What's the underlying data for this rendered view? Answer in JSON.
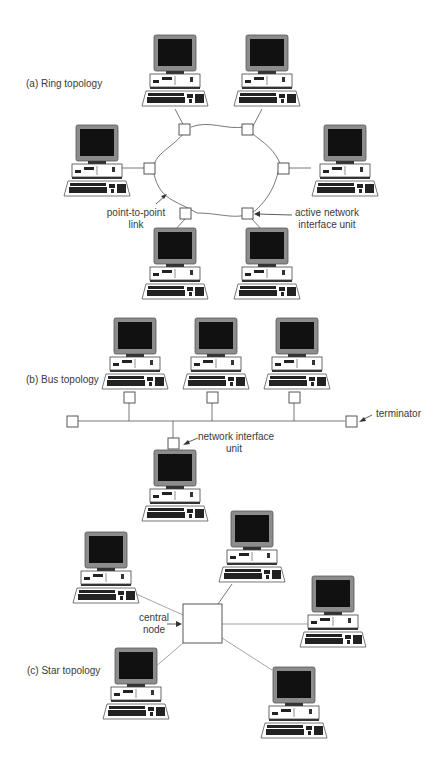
{
  "figure": {
    "sections": [
      {
        "id": "ring",
        "title": "(a) Ring topology",
        "annotations": {
          "link": [
            "point-to-point",
            "link"
          ],
          "niu": [
            "active network",
            "interface unit"
          ]
        },
        "computers": 6,
        "interface_units": 6
      },
      {
        "id": "bus",
        "title": "(b) Bus topology",
        "annotations": {
          "terminator": "terminator",
          "niu": [
            "network interface",
            "unit"
          ]
        },
        "computers": 4,
        "interface_units": 4,
        "terminators": 2
      },
      {
        "id": "star",
        "title": "(c) Star topology",
        "annotations": {
          "central": [
            "central",
            "node"
          ]
        },
        "computers": 5,
        "central_nodes": 1
      }
    ],
    "colors": {
      "line": "#555555",
      "monitor_bezel": "#8c8c8c",
      "screen": "#111111",
      "background": "#ffffff"
    }
  }
}
